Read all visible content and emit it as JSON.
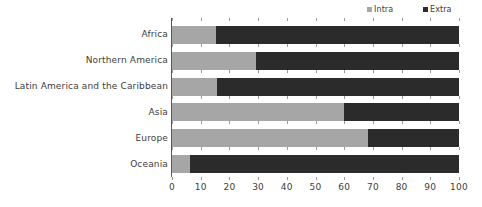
{
  "chart_data": {
    "type": "bar",
    "orientation": "horizontal",
    "stacked": true,
    "stacked_percent": true,
    "title": "",
    "subtitle": "",
    "xlabel": "",
    "ylabel": "",
    "xlim": [
      0,
      100
    ],
    "xticks": [
      0,
      10,
      20,
      30,
      40,
      50,
      60,
      70,
      80,
      90,
      100
    ],
    "xticklabels": [
      "0",
      "10",
      "20",
      "30",
      "40",
      "50",
      "60",
      "70",
      "80",
      "90",
      "100"
    ],
    "grid": false,
    "legend_position": "top-right",
    "categories": [
      "Africa",
      "Northern America",
      "Latin America and the Caribbean",
      "Asia",
      "Europe",
      "Oceania"
    ],
    "series": [
      {
        "name": "Intra",
        "color": "#a6a6a6",
        "values": [
          15.3,
          29.3,
          15.7,
          60.0,
          68.3,
          6.3
        ]
      },
      {
        "name": "Extra",
        "color": "#2b2b2b",
        "values": [
          84.7,
          70.7,
          84.3,
          40.0,
          31.7,
          93.7
        ]
      }
    ]
  },
  "legend": {
    "items": [
      {
        "label": "Intra",
        "color": "#a6a6a6",
        "marker": "square-swatch-icon"
      },
      {
        "label": "Extra",
        "color": "#2b2b2b",
        "marker": "square-swatch-icon"
      }
    ]
  },
  "axis": {
    "baseline_color": "#595959",
    "tick_color": "#9a9a9a"
  }
}
